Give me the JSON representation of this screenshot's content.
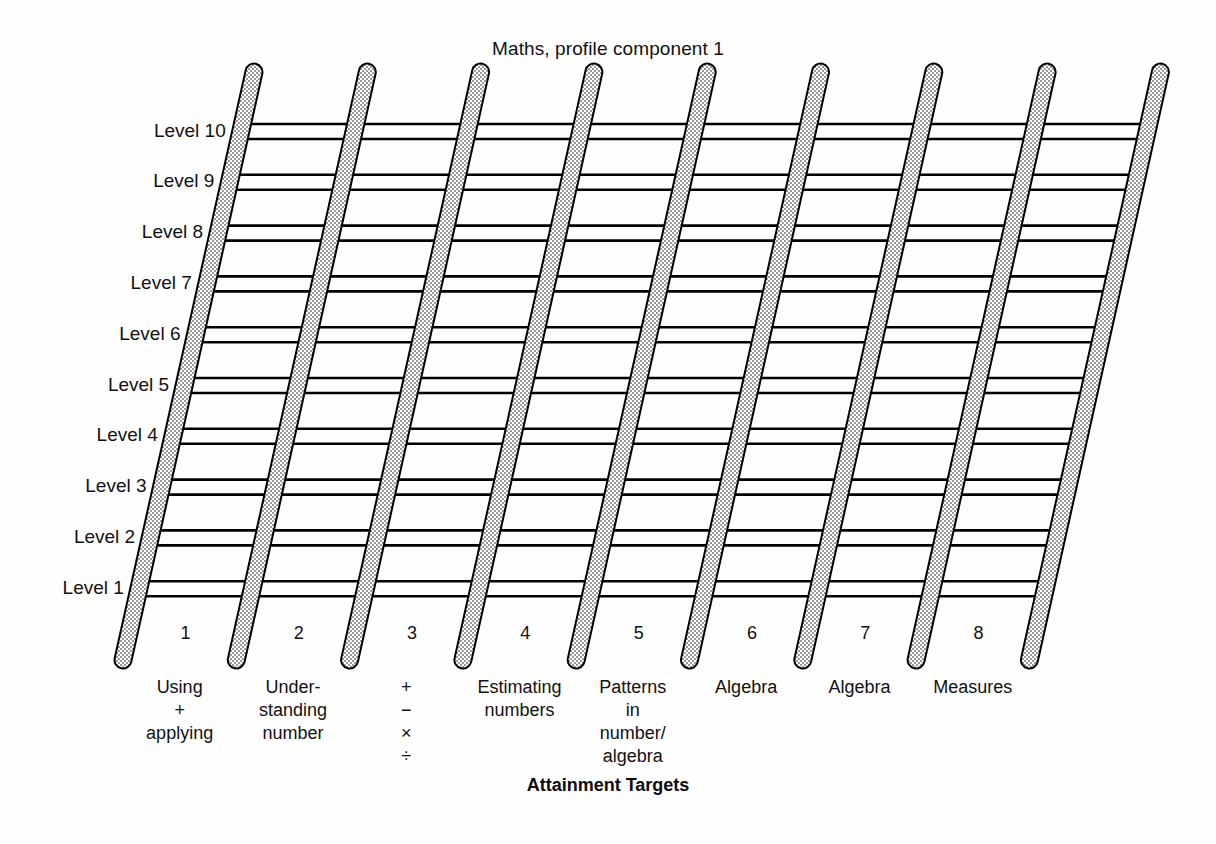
{
  "figure": {
    "title": "Maths, profile component 1",
    "axis_caption": "Attainment Targets"
  },
  "levels": [
    {
      "label": "Level 10"
    },
    {
      "label": "Level 9"
    },
    {
      "label": "Level 8"
    },
    {
      "label": "Level 7"
    },
    {
      "label": "Level 6"
    },
    {
      "label": "Level 5"
    },
    {
      "label": "Level 4"
    },
    {
      "label": "Level 3"
    },
    {
      "label": "Level 2"
    },
    {
      "label": "Level 1"
    }
  ],
  "targets": [
    {
      "number": "1",
      "lines": [
        "Using",
        "+",
        "applying"
      ]
    },
    {
      "number": "2",
      "lines": [
        "Under-",
        "standing",
        "number"
      ]
    },
    {
      "number": "3",
      "lines": [
        "+",
        "−",
        "×",
        "÷"
      ]
    },
    {
      "number": "4",
      "lines": [
        "Estimating",
        "numbers"
      ]
    },
    {
      "number": "5",
      "lines": [
        "Patterns",
        "in",
        "number/",
        "algebra"
      ]
    },
    {
      "number": "6",
      "lines": [
        "Algebra"
      ]
    },
    {
      "number": "7",
      "lines": [
        "Algebra"
      ]
    },
    {
      "number": "8",
      "lines": [
        "Measures"
      ]
    }
  ],
  "chart_data": {
    "type": "table",
    "title": "Maths, profile component 1",
    "xlabel": "Attainment Targets",
    "ylabel": "",
    "rail_count": 9,
    "rung_pairs": 10,
    "categories": [
      "1",
      "2",
      "3",
      "4",
      "5",
      "6",
      "7",
      "8"
    ],
    "category_labels": [
      "Using + applying",
      "Understanding number",
      "+ − × ÷",
      "Estimating numbers",
      "Patterns in number/algebra",
      "Algebra",
      "Algebra",
      "Measures"
    ],
    "y_tick_labels": [
      "Level 1",
      "Level 2",
      "Level 3",
      "Level 4",
      "Level 5",
      "Level 6",
      "Level 7",
      "Level 8",
      "Level 9",
      "Level 10"
    ],
    "ylim": [
      1,
      10
    ],
    "grid": true,
    "legend": "none",
    "colors": {
      "ink": "#000000",
      "rail_fill": "#d9d9d9",
      "background": "#ffffff"
    }
  },
  "geometry": {
    "rail_top_y": 72,
    "rail_bottom_y": 660,
    "rail_top_x_first": 254,
    "rail_bottom_x_first": 123,
    "rail_spacing": 113.3,
    "rail_width": 15,
    "level_top_y": 124,
    "level_step_y": 50.8,
    "rung_gap": 15
  }
}
